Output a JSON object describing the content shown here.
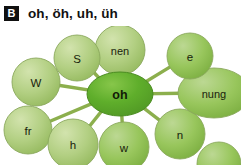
{
  "header": {
    "badge": "B",
    "title": "oh, öh, uh, üh"
  },
  "diagram": {
    "type": "radial-word-web",
    "colors": {
      "center_fill": "#5faa2d",
      "center_fill_light": "#7dbe49",
      "node_fill": "#a9c977",
      "node_fill_light": "#c5da9b",
      "node_fill_strong": "#8cbd52",
      "edge": "#86ab44",
      "node_stroke": "#8aa85c",
      "text": "#18220c",
      "badge_bg": "#101010",
      "background": "#ffffff"
    },
    "center": {
      "label": "oh",
      "shape": "ellipse",
      "cx": 120,
      "cy": 68,
      "rx": 33,
      "ry": 22
    },
    "nodes": [
      {
        "id": "nen",
        "label": "nen",
        "shape": "circle",
        "cx": 120,
        "cy": 24,
        "rx": 25,
        "ry": 25
      },
      {
        "id": "s",
        "label": "S",
        "shape": "circle",
        "cx": 77,
        "cy": 32,
        "rx": 23,
        "ry": 23
      },
      {
        "id": "w-up",
        "label": "W",
        "shape": "circle",
        "cx": 36,
        "cy": 56,
        "rx": 24,
        "ry": 24
      },
      {
        "id": "fr",
        "label": "fr",
        "shape": "circle",
        "cx": 28,
        "cy": 104,
        "rx": 24,
        "ry": 24
      },
      {
        "id": "h",
        "label": "h",
        "shape": "circle",
        "cx": 73,
        "cy": 118,
        "rx": 25,
        "ry": 25
      },
      {
        "id": "w-dn",
        "label": "w",
        "shape": "circle",
        "cx": 124,
        "cy": 121,
        "rx": 25,
        "ry": 25
      },
      {
        "id": "n",
        "label": "n",
        "shape": "circle",
        "cx": 180,
        "cy": 108,
        "rx": 25,
        "ry": 25
      },
      {
        "id": "nung",
        "label": "nung",
        "shape": "ellipse",
        "cx": 214,
        "cy": 67,
        "rx": 36,
        "ry": 25
      },
      {
        "id": "e",
        "label": "e",
        "shape": "circle",
        "cx": 190,
        "cy": 30,
        "rx": 23,
        "ry": 23
      },
      {
        "id": "cut",
        "label": "",
        "shape": "circle",
        "cx": 219,
        "cy": 138,
        "rx": 22,
        "ry": 22
      }
    ],
    "edges": [
      {
        "from": "oh",
        "to": "nen"
      },
      {
        "from": "oh",
        "to": "s"
      },
      {
        "from": "oh",
        "to": "w-up"
      },
      {
        "from": "oh",
        "to": "fr"
      },
      {
        "from": "oh",
        "to": "h"
      },
      {
        "from": "oh",
        "to": "w-dn"
      },
      {
        "from": "oh",
        "to": "n"
      },
      {
        "from": "oh",
        "to": "nung"
      },
      {
        "from": "oh",
        "to": "e"
      }
    ]
  }
}
